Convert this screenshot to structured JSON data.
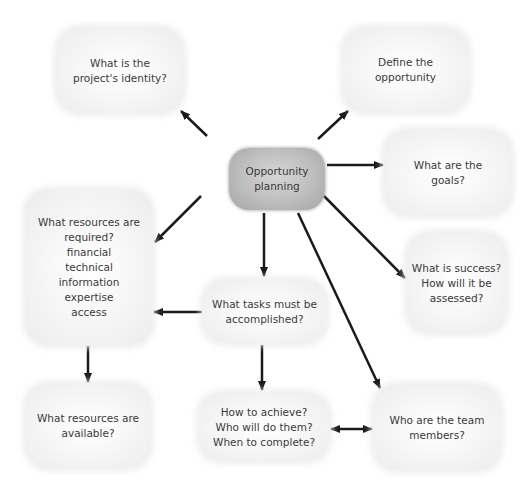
{
  "diagram": {
    "type": "mind-map",
    "center": {
      "id": "center",
      "label": "Opportunity\nplanning"
    },
    "nodes": [
      {
        "id": "identity",
        "label": "What is the\nproject's identity?"
      },
      {
        "id": "define",
        "label": "Define the\nopportunity"
      },
      {
        "id": "goals",
        "label": "What are the\ngoals?"
      },
      {
        "id": "success",
        "label": "What is success?\nHow will it be\nassessed?"
      },
      {
        "id": "resources_required",
        "label": "What resources are\nrequired?\nfinancial\ntechnical\ninformation\nexpertise\naccess"
      },
      {
        "id": "tasks",
        "label": "What tasks must be\naccomplished?"
      },
      {
        "id": "resources_available",
        "label": "What resources are\navailable?"
      },
      {
        "id": "how",
        "label": "How to achieve?\nWho will do them?\nWhen to complete?"
      },
      {
        "id": "team",
        "label": "Who are the team\nmembers?"
      }
    ],
    "edges": [
      {
        "from": "center",
        "to": "identity",
        "direction": "forward"
      },
      {
        "from": "center",
        "to": "define",
        "direction": "forward"
      },
      {
        "from": "center",
        "to": "goals",
        "direction": "forward"
      },
      {
        "from": "center",
        "to": "success",
        "direction": "forward"
      },
      {
        "from": "center",
        "to": "resources_required",
        "direction": "forward"
      },
      {
        "from": "center",
        "to": "tasks",
        "direction": "forward"
      },
      {
        "from": "center",
        "to": "team",
        "direction": "forward"
      },
      {
        "from": "tasks",
        "to": "resources_required",
        "direction": "forward"
      },
      {
        "from": "tasks",
        "to": "how",
        "direction": "forward"
      },
      {
        "from": "resources_required",
        "to": "resources_available",
        "direction": "forward"
      },
      {
        "from": "how",
        "to": "team",
        "direction": "both"
      }
    ]
  },
  "colors": {
    "arrow": "#1a1a1a",
    "node_fill": "#f2f2f2",
    "center_fill": "#b8b8b8",
    "text": "#3a3a3a"
  }
}
